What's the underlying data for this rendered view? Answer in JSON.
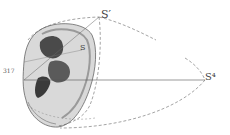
{
  "figure": {
    "number": "317",
    "labels": {
      "s_prime": "S′",
      "s": "S",
      "s_four": "S⁴"
    }
  },
  "colors": {
    "background": "#ffffff",
    "ink": "#555555",
    "ear_fill": "#d8d8d8",
    "ear_shadow": "#4a4a4a"
  }
}
